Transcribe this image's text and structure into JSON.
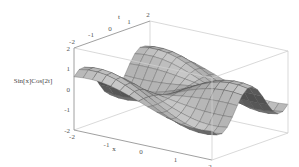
{
  "chart_data": {
    "type": "surface3d",
    "function": "Sin[x]Cos[2t]",
    "title": "",
    "xlabel": "x",
    "ylabel": "t",
    "zlabel": "Sin[x]Cos[2t]",
    "xlim": [
      -2,
      2
    ],
    "ylim": [
      -2,
      2
    ],
    "zlim": [
      -2,
      2
    ],
    "x_ticks": [
      "-2",
      "-1",
      "0",
      "1",
      "2"
    ],
    "y_ticks": [
      "-2",
      "-1",
      "0",
      "1",
      "2"
    ],
    "z_ticks": [
      "-2",
      "-1",
      "0",
      "1",
      "2"
    ],
    "mesh_lines": 15,
    "surface_color": "#9a9a9a",
    "box_color": "#cfcfcf"
  }
}
